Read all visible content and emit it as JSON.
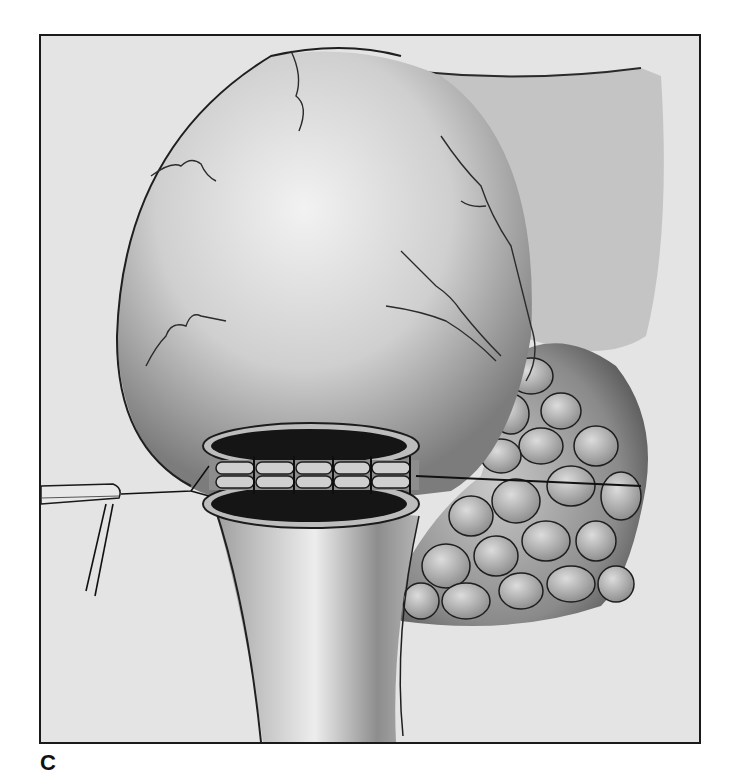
{
  "figure": {
    "panel_label": "C",
    "colors": {
      "frame_border": "#1a1a1a",
      "background": "#e4e4e4",
      "organ_light": "#ececec",
      "organ_shadow": "#7a7a7a",
      "incision_dark": "#151515",
      "lobule": "#a8a8a8"
    }
  }
}
